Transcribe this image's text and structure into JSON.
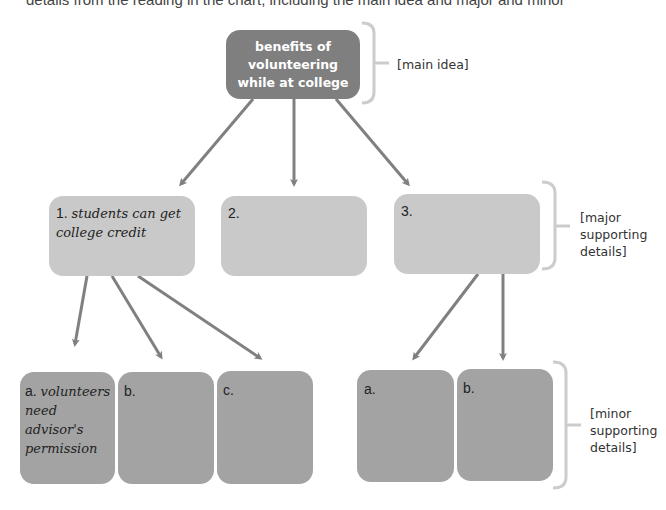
{
  "top_text": "details from the reading in the chart, including the main idea and major and minor",
  "main_idea": {
    "text": "benefits of volunteering while at college"
  },
  "major": [
    {
      "number": "1.",
      "text": "students can get college credit"
    },
    {
      "number": "2.",
      "text": ""
    },
    {
      "number": "3.",
      "text": ""
    }
  ],
  "minor_group1": [
    {
      "letter": "a.",
      "text": "volunteers need advisor's permission"
    },
    {
      "letter": "b.",
      "text": ""
    },
    {
      "letter": "c.",
      "text": ""
    }
  ],
  "minor_group3": [
    {
      "letter": "a.",
      "text": ""
    },
    {
      "letter": "b.",
      "text": ""
    }
  ],
  "brackets": {
    "main": "[main idea]",
    "major_l1": "[major",
    "major_l2": "supporting",
    "major_l3": "details]",
    "minor_l1": "[minor",
    "minor_l2": "supporting",
    "minor_l3": "details]"
  },
  "colors": {
    "main_box": "#7f7f7f",
    "major_box": "#c9c9c9",
    "minor_box": "#a3a3a3",
    "arrow": "#808080",
    "bracket": "#cccccc"
  }
}
